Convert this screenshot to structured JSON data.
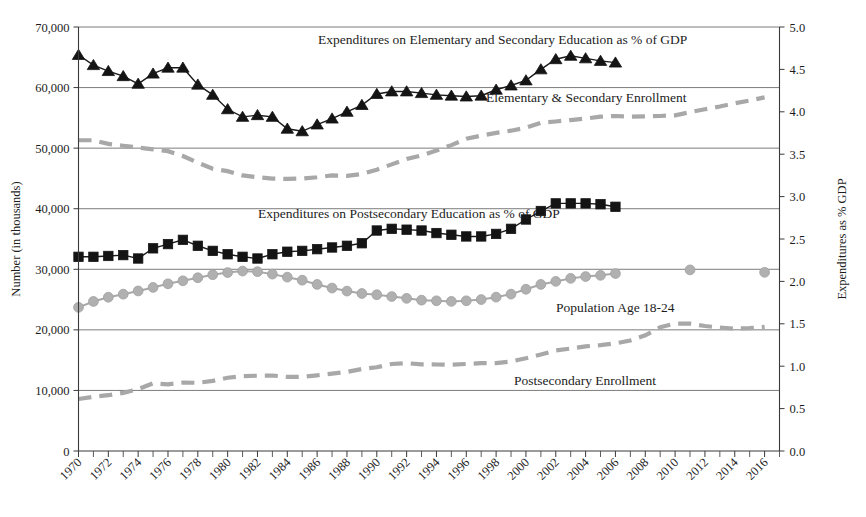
{
  "chart_data": {
    "type": "line",
    "title": "",
    "xlabel": "",
    "ylabel": "Number (in thousands)",
    "y2label": "Expenditures as % GDP",
    "xlim": [
      1970,
      2017
    ],
    "ylim": [
      0,
      70000
    ],
    "y2lim": [
      0.0,
      5.0
    ],
    "grid": true,
    "legend_position": "inline-annotations",
    "x_tick_labels": [
      "1970",
      "1972",
      "1974",
      "1976",
      "1978",
      "1980",
      "1982",
      "1984",
      "1986",
      "1988",
      "1990",
      "1992",
      "1994",
      "1996",
      "1998",
      "2000",
      "2002",
      "2004",
      "2006",
      "2008",
      "2010",
      "2012",
      "2014",
      "2016"
    ],
    "x_tick_values": [
      1970,
      1972,
      1974,
      1976,
      1978,
      1980,
      1982,
      1984,
      1986,
      1988,
      1990,
      1992,
      1994,
      1996,
      1998,
      2000,
      2002,
      2004,
      2006,
      2008,
      2010,
      2012,
      2014,
      2016
    ],
    "y_tick_labels": [
      "0",
      "10,000",
      "20,000",
      "30,000",
      "40,000",
      "50,000",
      "60,000",
      "70,000"
    ],
    "y_tick_values": [
      0,
      10000,
      20000,
      30000,
      40000,
      50000,
      60000,
      70000
    ],
    "y2_tick_labels": [
      "0.0",
      "0.5",
      "1.0",
      "1.5",
      "2.0",
      "2.5",
      "3.0",
      "3.5",
      "4.0",
      "4.5",
      "5.0"
    ],
    "y2_tick_values": [
      0.0,
      0.5,
      1.0,
      1.5,
      2.0,
      2.5,
      3.0,
      3.5,
      4.0,
      4.5,
      5.0
    ],
    "series": [
      {
        "name": "Expenditures on Elementary and Secondary Education as % of GDP",
        "axis": "right",
        "marker": "triangle",
        "color": "#141414",
        "style": "solid",
        "x": [
          1970,
          1971,
          1972,
          1973,
          1974,
          1975,
          1976,
          1977,
          1978,
          1979,
          1980,
          1981,
          1982,
          1983,
          1984,
          1985,
          1986,
          1987,
          1988,
          1989,
          1990,
          1991,
          1992,
          1993,
          1994,
          1995,
          1996,
          1997,
          1998,
          1999,
          2000,
          2001,
          2002,
          2003,
          2004,
          2005,
          2006
        ],
        "values": [
          4.67,
          4.55,
          4.48,
          4.42,
          4.33,
          4.45,
          4.52,
          4.52,
          4.32,
          4.2,
          4.03,
          3.94,
          3.96,
          3.94,
          3.8,
          3.77,
          3.85,
          3.92,
          4.0,
          4.08,
          4.21,
          4.24,
          4.24,
          4.22,
          4.2,
          4.19,
          4.18,
          4.19,
          4.26,
          4.31,
          4.37,
          4.5,
          4.62,
          4.66,
          4.63,
          4.6,
          4.58
        ]
      },
      {
        "name": "Elementary & Secondary Enrollment",
        "axis": "left",
        "marker": "none",
        "color": "#a8a8a8",
        "style": "dashed",
        "x": [
          1970,
          1971,
          1972,
          1973,
          1974,
          1975,
          1976,
          1977,
          1978,
          1979,
          1980,
          1981,
          1982,
          1983,
          1984,
          1985,
          1986,
          1987,
          1988,
          1989,
          1990,
          1991,
          1992,
          1993,
          1994,
          1995,
          1996,
          1997,
          1998,
          1999,
          2000,
          2001,
          2002,
          2003,
          2004,
          2005,
          2006,
          2007,
          2008,
          2009,
          2010,
          2011,
          2012,
          2013,
          2014,
          2015,
          2016
        ],
        "values": [
          51300,
          51300,
          50700,
          50400,
          50100,
          49800,
          49500,
          48700,
          47600,
          46600,
          46200,
          45500,
          45200,
          44970,
          44910,
          44980,
          45200,
          45490,
          45430,
          45740,
          46450,
          47320,
          48200,
          48810,
          49610,
          50500,
          51540,
          52070,
          52530,
          52880,
          53370,
          54180,
          54400,
          54640,
          54880,
          55190,
          55310,
          55200,
          55240,
          55310,
          55420,
          55940,
          56420,
          56880,
          57400,
          57870,
          58380
        ]
      },
      {
        "name": "Expenditures on Postsecondary Education as % of GDP",
        "axis": "right",
        "marker": "square",
        "color": "#141414",
        "style": "solid",
        "x": [
          1970,
          1971,
          1972,
          1973,
          1974,
          1975,
          1976,
          1977,
          1978,
          1979,
          1980,
          1981,
          1982,
          1983,
          1984,
          1985,
          1986,
          1987,
          1988,
          1989,
          1990,
          1991,
          1992,
          1993,
          1994,
          1995,
          1996,
          1997,
          1998,
          1999,
          2000,
          2001,
          2002,
          2003,
          2004,
          2005,
          2006
        ],
        "values": [
          2.29,
          2.29,
          2.3,
          2.31,
          2.27,
          2.39,
          2.44,
          2.49,
          2.42,
          2.36,
          2.32,
          2.29,
          2.27,
          2.32,
          2.35,
          2.36,
          2.38,
          2.4,
          2.42,
          2.45,
          2.6,
          2.62,
          2.61,
          2.6,
          2.57,
          2.55,
          2.53,
          2.53,
          2.56,
          2.62,
          2.73,
          2.83,
          2.92,
          2.92,
          2.92,
          2.91,
          2.88
        ]
      },
      {
        "name": "Population Age 18-24",
        "axis": "left",
        "marker": "circle",
        "color": "#b0b0b0",
        "style": "solid",
        "x": [
          1970,
          1971,
          1972,
          1973,
          1974,
          1975,
          1976,
          1977,
          1978,
          1979,
          1980,
          1981,
          1982,
          1983,
          1984,
          1985,
          1986,
          1987,
          1988,
          1989,
          1990,
          1991,
          1992,
          1993,
          1994,
          1995,
          1996,
          1997,
          1998,
          1999,
          2000,
          2001,
          2002,
          2003,
          2004,
          2005,
          2006
        ],
        "values": [
          23714,
          24687,
          25386,
          25890,
          26420,
          27000,
          27600,
          28100,
          28600,
          29100,
          29460,
          29700,
          29600,
          29200,
          28700,
          28200,
          27500,
          26900,
          26400,
          26000,
          25800,
          25500,
          25200,
          24900,
          24800,
          24700,
          24800,
          25000,
          25400,
          25900,
          26700,
          27500,
          28000,
          28500,
          28800,
          29000,
          29300
        ],
        "extra_points": [
          {
            "x": 2011,
            "y": 29900
          },
          {
            "x": 2016,
            "y": 29500
          }
        ]
      },
      {
        "name": "Postsecondary Enrollment",
        "axis": "left",
        "marker": "none",
        "color": "#a8a8a8",
        "style": "dashed",
        "x": [
          1970,
          1971,
          1972,
          1973,
          1974,
          1975,
          1976,
          1977,
          1978,
          1979,
          1980,
          1981,
          1982,
          1983,
          1984,
          1985,
          1986,
          1987,
          1988,
          1989,
          1990,
          1991,
          1992,
          1993,
          1994,
          1995,
          1996,
          1997,
          1998,
          1999,
          2000,
          2001,
          2002,
          2003,
          2004,
          2005,
          2006,
          2007,
          2008,
          2009,
          2010,
          2011,
          2012,
          2013,
          2014,
          2015,
          2016
        ],
        "values": [
          8580,
          8950,
          9210,
          9600,
          10220,
          11180,
          11010,
          11290,
          11260,
          11570,
          12100,
          12370,
          12430,
          12460,
          12240,
          12250,
          12500,
          12770,
          13050,
          13540,
          13820,
          14360,
          14490,
          14310,
          14280,
          14260,
          14370,
          14500,
          14510,
          14790,
          15310,
          15930,
          16610,
          16910,
          17270,
          17480,
          17760,
          18250,
          19100,
          20430,
          21020,
          21020,
          20640,
          20380,
          20200,
          20280,
          20500
        ]
      }
    ],
    "annotations": [
      {
        "id": "ann-elem-sec-exp",
        "text": "Expenditures on Elementary and Secondary Education as % of GDP",
        "x_px": 318,
        "y_px": 44
      },
      {
        "id": "ann-elem-sec-enroll",
        "text": "Elementary & Secondary Enrollment",
        "x_px": 486,
        "y_px": 102
      },
      {
        "id": "ann-postsec-exp",
        "text": "Expenditures on Postsecondary Education as % of GDP",
        "x_px": 258,
        "y_px": 218
      },
      {
        "id": "ann-population",
        "text": "Population Age 18-24",
        "x_px": 556,
        "y_px": 312
      },
      {
        "id": "ann-postsec-enroll",
        "text": "Postsecondary Enrollment",
        "x_px": 514,
        "y_px": 385
      }
    ],
    "colors": {
      "series_dark": "#141414",
      "series_gray": "#b0b0b0",
      "dashed_gray": "#a8a8a8",
      "axis": "#3a3a3a",
      "grid": "#6e6e6e",
      "text": "#1c1c1c",
      "background": "#ffffff"
    }
  }
}
